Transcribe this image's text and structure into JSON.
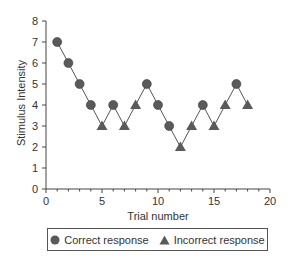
{
  "chart_data": {
    "type": "line",
    "title": "",
    "xlabel": "Trial number",
    "ylabel": "Stimulus Intensity",
    "xlim": [
      0,
      20
    ],
    "ylim": [
      0,
      8
    ],
    "xticks": [
      0,
      5,
      10,
      15,
      20
    ],
    "yticks": [
      0,
      1,
      2,
      3,
      4,
      5,
      6,
      7,
      8
    ],
    "grid": false,
    "legend_position": "bottom",
    "legend": [
      "Correct response",
      "Incorrect response"
    ],
    "x": [
      1,
      2,
      3,
      4,
      5,
      6,
      7,
      8,
      9,
      10,
      11,
      12,
      13,
      14,
      15,
      16,
      17,
      18
    ],
    "y": [
      7,
      6,
      5,
      4,
      3,
      4,
      3,
      4,
      5,
      4,
      3,
      2,
      3,
      4,
      3,
      4,
      5,
      4
    ],
    "response": [
      "correct",
      "correct",
      "correct",
      "correct",
      "incorrect",
      "correct",
      "incorrect",
      "incorrect",
      "correct",
      "correct",
      "correct",
      "incorrect",
      "incorrect",
      "correct",
      "incorrect",
      "incorrect",
      "correct",
      "incorrect"
    ],
    "marker_color": "#5a5a5a",
    "line_color": "#555555"
  },
  "legend": {
    "correct_label": "Correct response",
    "incorrect_label": "Incorrect response"
  },
  "axes": {
    "xlabel": "Trial number",
    "ylabel": "Stimulus Intensity"
  }
}
